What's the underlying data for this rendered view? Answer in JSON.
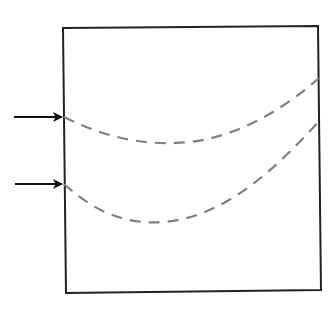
{
  "diagram": {
    "type": "box-with-dashed-curves-and-input-arrows",
    "colors": {
      "box_stroke": "#222222",
      "arrow": "#111111",
      "dashed_curve": "#808080",
      "background": "#ffffff"
    },
    "box": {
      "points": "63,28 318,26 321,290 66,293"
    },
    "arrows": [
      {
        "name": "upper-input-arrow",
        "x1": 14,
        "y1": 117,
        "x2": 62,
        "y2": 117
      },
      {
        "name": "lower-input-arrow",
        "x1": 15,
        "y1": 184,
        "x2": 62,
        "y2": 184
      }
    ],
    "curves": [
      {
        "name": "upper-dashed-curve",
        "d": "M64,117 C110,140 150,146 190,142 C240,136 285,108 319,78"
      },
      {
        "name": "lower-dashed-curve",
        "d": "M64,184 C95,212 125,225 165,222 C225,216 275,170 321,119"
      }
    ]
  }
}
